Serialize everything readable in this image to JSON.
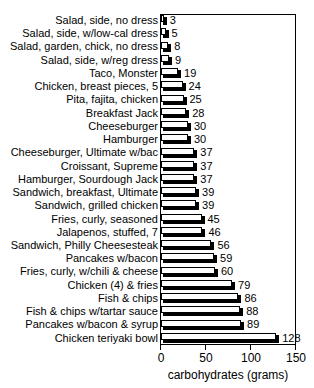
{
  "chart_data": {
    "type": "bar",
    "orientation": "horizontal",
    "title": "",
    "xlabel": "carbohydrates (grams)",
    "ylabel": "",
    "xlim": [
      0,
      150
    ],
    "xticks": [
      0,
      50,
      100,
      150
    ],
    "xticklabels": [
      "0",
      "50",
      "100",
      "150"
    ],
    "grid": false,
    "legend": null,
    "categories": [
      "Salad, side, no dress",
      "Salad, side, w/low-cal dress",
      "Salad, garden, chick, no dress",
      "Salad, side, w/reg dress",
      "Taco, Monster",
      "Chicken, breast pieces, 5",
      "Pita, fajita, chicken",
      "Breakfast Jack",
      "Cheeseburger",
      "Hamburger",
      "Cheeseburger, Ultimate w/bac",
      "Croissant, Supreme",
      "Hamburger, Sourdough Jack",
      "Sandwich, breakfast, Ultimate",
      "Sandwich, grilled chicken",
      "Fries, curly, seasoned",
      "Jalapenos, stuffed, 7",
      "Sandwich, Philly Cheesesteak",
      "Pancakes w/bacon",
      "Fries, curly, w/chili & cheese",
      "Chicken (4) & fries",
      "Fish & chips",
      "Fish & chips w/tartar sauce",
      "Pancakes w/bacon & syrup",
      "Chicken teriyaki bowl"
    ],
    "values": [
      3,
      5,
      8,
      9,
      19,
      24,
      25,
      28,
      30,
      30,
      37,
      37,
      37,
      39,
      39,
      45,
      46,
      56,
      59,
      60,
      79,
      86,
      88,
      89,
      128
    ],
    "value_labels": [
      "3",
      "5",
      "8",
      "9",
      "19",
      "24",
      "25",
      "28",
      "30",
      "30",
      "37",
      "37",
      "37",
      "39",
      "39",
      "45",
      "46",
      "56",
      "59",
      "60",
      "79",
      "86",
      "88",
      "89",
      "128"
    ],
    "colors": {
      "bar_fill": "#ffffff",
      "bar_edge": "#000000",
      "bar_shadow": "#000000",
      "text": "#000000",
      "background": "#ffffff"
    }
  }
}
